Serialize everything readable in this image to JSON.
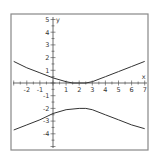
{
  "chart_data": {
    "type": "line",
    "title": "",
    "xlabel": "x",
    "ylabel": "y",
    "xlim": [
      -3,
      7
    ],
    "ylim": [
      -5,
      5
    ],
    "grid": false,
    "x_ticks": [
      -2,
      -1,
      1,
      2,
      3,
      4,
      5,
      6,
      7
    ],
    "y_ticks": [
      5,
      4,
      3,
      2,
      1,
      -1,
      -2,
      -3,
      -4
    ],
    "series": [
      {
        "name": "upper-branch",
        "x": [
          -3,
          -2,
          -1,
          0,
          1,
          1.5,
          2,
          2.5,
          3,
          4,
          5,
          6,
          7
        ],
        "y": [
          1.7,
          1.2,
          0.8,
          0.4,
          0.1,
          0.0,
          0.0,
          0.0,
          0.1,
          0.5,
          0.9,
          1.3,
          1.7
        ]
      },
      {
        "name": "lower-branch",
        "x": [
          -3,
          -2,
          -1,
          0,
          1,
          2,
          2.5,
          3,
          4,
          5,
          6,
          7
        ],
        "y": [
          -3.7,
          -3.3,
          -2.9,
          -2.4,
          -2.1,
          -2.0,
          -2.0,
          -2.1,
          -2.5,
          -2.9,
          -3.3,
          -3.6
        ]
      }
    ]
  },
  "frame": {
    "color": "#888888"
  },
  "curve_color": "#333333"
}
